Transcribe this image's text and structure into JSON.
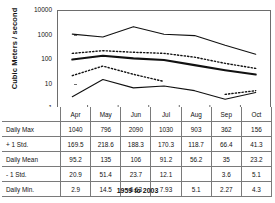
{
  "chart_data": {
    "type": "line",
    "title": "",
    "xlabel": "",
    "ylabel": "Cubic Meters / second",
    "yscale": "log",
    "ylim": [
      1,
      10000
    ],
    "ytick_labels": [
      "10000",
      "1000",
      "100",
      "10",
      "1"
    ],
    "ytick_values": [
      10000,
      1000,
      100,
      10,
      1
    ],
    "grid": false,
    "legend": "none",
    "categories": [
      "Apr",
      "May",
      "Jun",
      "Jul",
      "Aug",
      "Sep",
      "Oct"
    ],
    "series": [
      {
        "name": "Daily Max",
        "style": "solid",
        "values": [
          1040,
          796,
          2090,
          1030,
          903,
          362,
          156
        ]
      },
      {
        "name": "+ 1 Std.",
        "style": "dotted",
        "values": [
          169.5,
          218.6,
          188.3,
          170.3,
          118.7,
          66.4,
          41.3
        ]
      },
      {
        "name": "Daily Mean",
        "style": "solid-thick",
        "values": [
          95.2,
          135,
          106,
          91.2,
          56.2,
          35,
          23.2
        ]
      },
      {
        "name": "- 1 Std.",
        "style": "dotted",
        "values": [
          20.9,
          51.4,
          23.7,
          12.1,
          null,
          3.6,
          5.1
        ]
      },
      {
        "name": "Daily Min.",
        "style": "solid",
        "values": [
          2.9,
          14.5,
          6.63,
          7.93,
          5.1,
          2.27,
          4.3
        ]
      }
    ]
  },
  "table": {
    "corner_label": "",
    "columns": [
      "Apr",
      "May",
      "Jun",
      "Jul",
      "Aug",
      "Sep",
      "Oct"
    ],
    "rows": [
      {
        "label": "Daily Max",
        "cells": [
          "1040",
          "796",
          "2090",
          "1030",
          "903",
          "362",
          "156"
        ]
      },
      {
        "label": "+ 1 Std.",
        "cells": [
          "169.5",
          "218.6",
          "188.3",
          "170.3",
          "118.7",
          "66.4",
          "41.3"
        ]
      },
      {
        "label": "Daily Mean",
        "cells": [
          "95.2",
          "135",
          "106",
          "91.2",
          "56.2",
          "35",
          "23.2"
        ]
      },
      {
        "label": "- 1 Std.",
        "cells": [
          "20.9",
          "51.4",
          "23.7",
          "12.1",
          "",
          "3.6",
          "5.1"
        ]
      },
      {
        "label": "Daily Min.",
        "cells": [
          "2.9",
          "14.5",
          "6.63",
          "7.93",
          "5.1",
          "2.27",
          "4.3"
        ]
      }
    ]
  },
  "footer": {
    "caption": "1959 to 2003"
  },
  "colors": {
    "line": "#111111",
    "axis": "#6d6d6d",
    "border": "#7a7a7a",
    "background": "#ffffff"
  }
}
